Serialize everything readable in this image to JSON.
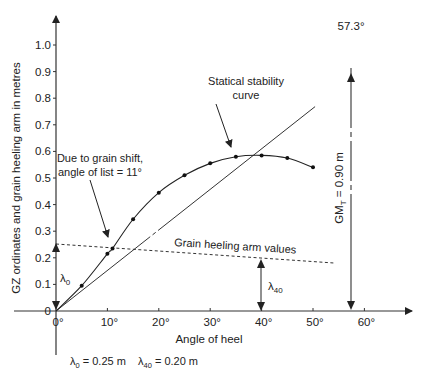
{
  "chart_data": {
    "type": "line",
    "title": "",
    "xlabel": "Angle of heel",
    "ylabel": "GZ ordinates and grain heeling arm in metres",
    "xlim": [
      0,
      62
    ],
    "ylim": [
      0,
      1.05
    ],
    "x_ticks": [
      "0°",
      "10°",
      "20°",
      "30°",
      "40°",
      "50°",
      "60°"
    ],
    "y_ticks": [
      "0",
      "0.1",
      "0.2",
      "0.3",
      "0.4",
      "0.5",
      "0.6",
      "0.7",
      "0.8",
      "0.9",
      "1.0"
    ],
    "grid": false,
    "series": [
      {
        "name": "Statical stability curve",
        "x": [
          0,
          5,
          10,
          11,
          15,
          20,
          25,
          30,
          35,
          40,
          45,
          50
        ],
        "y": [
          0,
          0.095,
          0.215,
          0.235,
          0.345,
          0.445,
          0.51,
          0.555,
          0.58,
          0.585,
          0.575,
          0.54
        ]
      },
      {
        "name": "Grain heeling arm values",
        "style": "dashed",
        "x": [
          0,
          54
        ],
        "y": [
          0.25,
          0.18
        ]
      },
      {
        "name": "GM tangent",
        "x": [
          0,
          57.3,
          62
        ],
        "y": [
          0,
          0.9,
          0.97
        ]
      }
    ],
    "annotations": [
      {
        "text": "Statical stability curve",
        "x": 35,
        "y": 0.58
      },
      {
        "text": "Due to grain shift, angle of list = 11°",
        "x": 11,
        "y": 0.235
      },
      {
        "text": "Grain heeling arm values",
        "x": 30,
        "y": 0.2
      },
      {
        "text": "λ0",
        "x": 0,
        "y": 0.125
      },
      {
        "text": "λ40",
        "x": 40,
        "y": 0.1
      },
      {
        "text": "57.3°",
        "x": 57.3,
        "y": 1.05
      },
      {
        "text": "GMT = 0.90 m",
        "x": 57.3,
        "y": 0.45
      }
    ]
  },
  "labels": {
    "y_axis": "GZ ordinates and grain heeling arm in metres",
    "x_axis": "Angle of heel",
    "stat_curve_1": "Statical stability",
    "stat_curve_2": "curve",
    "grain_1": "Due to grain shift,",
    "grain_2": "angle of list = 11°",
    "heel_arm": "Grain heeling arm values",
    "lambda": "λ",
    "sub0": "0",
    "sub40": "40",
    "angle_57": "57.3°",
    "gm_prefix": "GM",
    "gm_sub": "T",
    "gm_value": " = 0.90 m",
    "footer_l0_value": " = 0.25 m",
    "footer_l40_value": " = 0.20 m",
    "origin": "0"
  }
}
